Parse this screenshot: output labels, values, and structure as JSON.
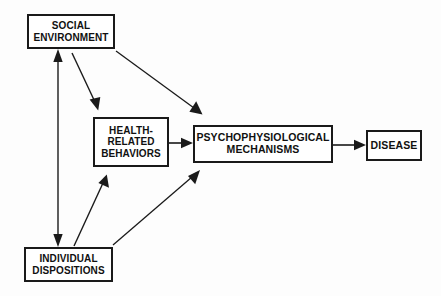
{
  "diagram": {
    "background_color": "#fdfdfd",
    "line_color": "#1a1a1a",
    "box_border_color": "#1a1a1a",
    "box_fill_color": "#ffffff",
    "text_color": "#111111",
    "nodes": [
      {
        "id": "social_environment",
        "label": "SOCIAL\nENVIRONMENT",
        "lines": [
          "SOCIAL",
          "ENVIRONMENT"
        ]
      },
      {
        "id": "health_related_behaviors",
        "label": "HEALTH-\nRELATED\nBEHAVIORS",
        "lines": [
          "HEALTH-",
          "RELATED",
          "BEHAVIORS"
        ]
      },
      {
        "id": "psychophysiological_mechanisms",
        "label": "PSYCHOPHYSIOLOGICAL\nMECHANISMS",
        "lines": [
          "PSYCHOPHYSIOLOGICAL",
          "MECHANISMS"
        ]
      },
      {
        "id": "disease",
        "label": "DISEASE",
        "lines": [
          "DISEASE"
        ]
      },
      {
        "id": "individual_dispositions",
        "label": "INDIVIDUAL\nDISPOSITIONS",
        "lines": [
          "INDIVIDUAL",
          "DISPOSITIONS"
        ]
      }
    ],
    "edges": [
      {
        "id": "social_env_to_individual_dispositions",
        "from": "social_environment",
        "to": "individual_dispositions",
        "arrowheads": "both",
        "style": "straight-vertical"
      },
      {
        "id": "social_env_to_health_behaviors",
        "from": "social_environment",
        "to": "health_related_behaviors",
        "arrowheads": "end",
        "style": "diagonal"
      },
      {
        "id": "social_env_to_mechanisms",
        "from": "social_environment",
        "to": "psychophysiological_mechanisms",
        "arrowheads": "end",
        "style": "diagonal"
      },
      {
        "id": "individual_dispositions_to_health_behaviors",
        "from": "individual_dispositions",
        "to": "health_related_behaviors",
        "arrowheads": "end",
        "style": "diagonal"
      },
      {
        "id": "individual_dispositions_to_mechanisms",
        "from": "individual_dispositions",
        "to": "psychophysiological_mechanisms",
        "arrowheads": "end",
        "style": "diagonal"
      },
      {
        "id": "health_behaviors_to_mechanisms",
        "from": "health_related_behaviors",
        "to": "psychophysiological_mechanisms",
        "arrowheads": "end",
        "style": "straight-horizontal"
      },
      {
        "id": "mechanisms_to_disease",
        "from": "psychophysiological_mechanisms",
        "to": "disease",
        "arrowheads": "end",
        "style": "straight-horizontal"
      }
    ]
  }
}
